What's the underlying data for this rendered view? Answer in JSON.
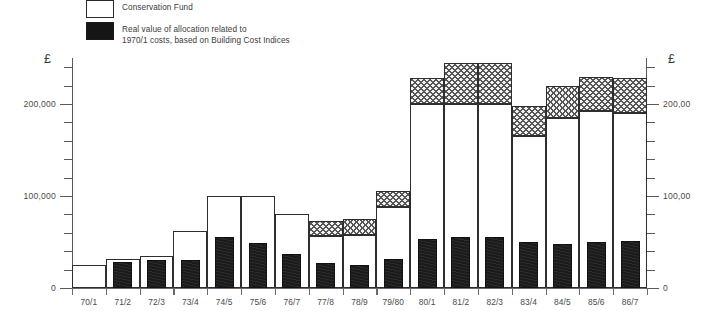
{
  "legend": {
    "items": [
      {
        "swatch": "open-rect-swatch",
        "label": "Conservation Fund"
      },
      {
        "swatch": "solid-black-swatch",
        "label": "Real value of allocation related to\n1970/1 costs, based on Building Cost Indices"
      }
    ]
  },
  "axes": {
    "left_currency_symbol": "£",
    "right_currency_symbol": "£",
    "left_tick_labels": [
      "200,000",
      "100,000",
      "0"
    ],
    "right_tick_labels": [
      "200,00",
      "100,00",
      "0"
    ]
  },
  "chart_data": {
    "type": "bar",
    "title": "",
    "xlabel": "",
    "ylabel": "£",
    "ylim": [
      0,
      250000
    ],
    "grid": false,
    "legend_position": "top-left",
    "y_major_ticks": [
      0,
      100000,
      200000
    ],
    "y_minor_tick_step": 20000,
    "categories": [
      "70/1",
      "71/2",
      "72/3",
      "73/4",
      "74/5",
      "75/6",
      "76/7",
      "77/8",
      "78/9",
      "79/80",
      "80/1",
      "81/2",
      "82/3",
      "83/4",
      "84/5",
      "85/6",
      "86/7"
    ],
    "series": [
      {
        "name": "Conservation Fund",
        "style": "open",
        "values": [
          25000,
          32000,
          35000,
          62000,
          100000,
          100000,
          80000,
          57000,
          58000,
          88000,
          200000,
          200000,
          200000,
          165000,
          185000,
          192000,
          190000
        ]
      },
      {
        "name": "Conservation Fund supplementary allocation",
        "style": "stipple",
        "values": [
          0,
          0,
          0,
          0,
          0,
          0,
          0,
          16000,
          17000,
          17000,
          28000,
          45000,
          45000,
          33000,
          35000,
          37000,
          38000
        ]
      },
      {
        "name": "Real value of allocation related to 1970/1 costs, based on Building Cost Indices",
        "style": "solid",
        "values": [
          0,
          28000,
          30000,
          30000,
          55000,
          49000,
          37000,
          27000,
          25000,
          32000,
          53000,
          55000,
          55000,
          50000,
          48000,
          50000,
          51000
        ]
      }
    ]
  }
}
